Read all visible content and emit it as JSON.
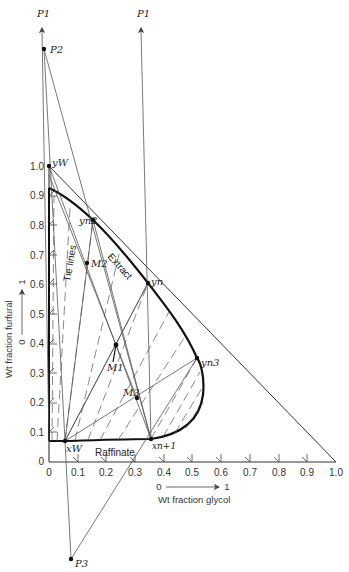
{
  "figure": {
    "type": "ternary-phase-diagram",
    "x_axis": {
      "label": "Wt fraction glycol",
      "direction_label_start": "0",
      "direction_label_end": "1",
      "ticks": [
        "0",
        "0.1",
        "0.2",
        "0.3",
        "0.4",
        "0.5",
        "0.6",
        "0.7",
        "0.8",
        "0.9",
        "1.0"
      ]
    },
    "y_axis": {
      "label": "Wt fraction furfural",
      "direction_label_start": "0",
      "direction_label_end": "1",
      "ticks": [
        "0",
        "0.1",
        "0.2",
        "0.3",
        "0.4",
        "0.5",
        "0.6",
        "0.7",
        "0.8",
        "0.9",
        "1.0"
      ]
    },
    "region_labels": {
      "extract": "Extract",
      "raffinate": "Raffinate",
      "tie_lines": "Tie lines"
    },
    "points": {
      "P1_left": "P1",
      "P1_right": "P1",
      "P2": "P2",
      "P3": "P3",
      "yW": "yW",
      "yn2": "yn2",
      "yn": "yn",
      "yn3": "yn3",
      "xW": "xW",
      "xn1": "xn+1",
      "M1": "M1",
      "M2": "M2",
      "M3": "M3"
    },
    "point_coords": {
      "yW": [
        0.0,
        1.0
      ],
      "xW": [
        0.05,
        0.07
      ],
      "xn1": [
        0.35,
        0.08
      ],
      "yn2": [
        0.15,
        0.82
      ],
      "yn": [
        0.35,
        0.6
      ],
      "yn3": [
        0.52,
        0.34
      ],
      "M1": [
        0.23,
        0.4
      ],
      "M2": [
        0.13,
        0.67
      ],
      "M3": [
        0.31,
        0.22
      ]
    }
  }
}
